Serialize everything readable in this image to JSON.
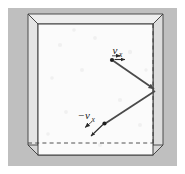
{
  "figure": {
    "background_color": "#ffffff",
    "panel_color": "#bfbfbf",
    "box_face_color": "#fbfbfb",
    "box_side_color": "#e8e8e8",
    "line_color": "#3c3c3c",
    "arrow_color": "#4a4a4a"
  },
  "labels": {
    "incoming": {
      "sign": "",
      "symbol": "v",
      "subscript": "x",
      "full": "v_x",
      "arrow_direction": "right"
    },
    "outgoing": {
      "sign": "−",
      "symbol": "v",
      "subscript": "x",
      "full": "−v_x",
      "arrow_direction": "down-left"
    }
  },
  "geometry": {
    "panel": {
      "x": 8,
      "y": 8,
      "width": 169,
      "height": 158
    },
    "box": {
      "front_face": {
        "left": 38,
        "top": 24,
        "right": 153,
        "bottom": 155
      },
      "back_face": {
        "left": 28,
        "top": 14,
        "right": 163,
        "bottom": 143
      },
      "depth_offset": {
        "dx": 10,
        "dy": -10
      }
    },
    "trajectory": {
      "start_point": {
        "x": 112,
        "y": 60
      },
      "wall_point": {
        "x": 155,
        "y": 90
      },
      "end_point": {
        "x": 104,
        "y": 124
      }
    },
    "speckles": [
      {
        "x": 60,
        "y": 45
      },
      {
        "x": 95,
        "y": 38
      },
      {
        "x": 130,
        "y": 52
      },
      {
        "x": 52,
        "y": 78
      },
      {
        "x": 82,
        "y": 70
      },
      {
        "x": 120,
        "y": 100
      },
      {
        "x": 66,
        "y": 112
      },
      {
        "x": 140,
        "y": 125
      },
      {
        "x": 48,
        "y": 134
      },
      {
        "x": 100,
        "y": 145
      },
      {
        "x": 146,
        "y": 70
      },
      {
        "x": 74,
        "y": 30
      }
    ]
  }
}
